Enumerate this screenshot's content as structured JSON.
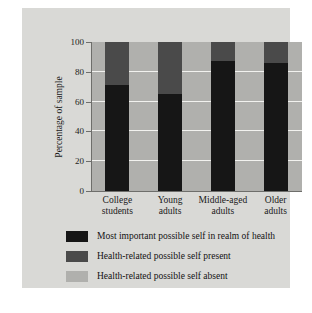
{
  "chart_data": {
    "type": "bar",
    "title": "",
    "subtitle": "",
    "xlabel": "",
    "ylabel": "Percentage of sample",
    "ylim": [
      0,
      100
    ],
    "yticks": [
      0,
      20,
      40,
      60,
      80,
      100
    ],
    "grid": true,
    "stacked": true,
    "legend_position": "bottom",
    "categories": [
      "College students",
      "Young adults",
      "Middle-aged adults",
      "Older adults"
    ],
    "category_lines": [
      [
        "College",
        "students"
      ],
      [
        "Young",
        "adults"
      ],
      [
        "Middle-aged",
        "adults"
      ],
      [
        "Older",
        "adults"
      ]
    ],
    "series": [
      {
        "name": "Most important possible self in realm of health",
        "color": "#161616",
        "values": [
          71,
          65,
          87,
          86
        ]
      },
      {
        "name": "Health-related possible self present",
        "color": "#4a4a4a",
        "values": [
          29,
          35,
          13,
          14
        ]
      },
      {
        "name": "Health-related possible self absent",
        "color": "#b0b0ad",
        "values": [
          0,
          0,
          0,
          0
        ]
      }
    ]
  },
  "axis": {
    "y_title": "Percentage of sample",
    "y_ticks": [
      "100",
      "80",
      "60",
      "40",
      "20",
      "0"
    ]
  },
  "legend": {
    "items": [
      {
        "label": "Most important possible self in realm of health",
        "color": "#161616"
      },
      {
        "label": "Health-related possible self present",
        "color": "#4a4a4a"
      },
      {
        "label": "Health-related possible self absent",
        "color": "#b0b0ad"
      }
    ]
  }
}
